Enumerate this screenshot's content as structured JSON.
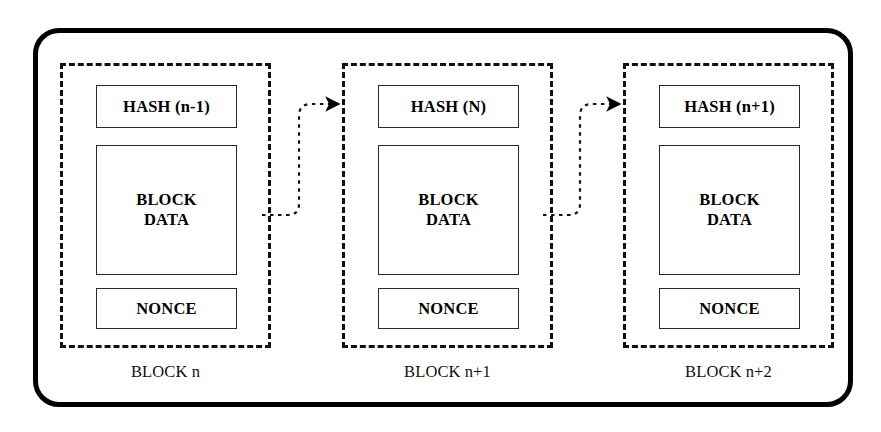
{
  "diagram": {
    "background_color": "#ffffff",
    "stroke_color": "#000000",
    "outer_frame": {
      "shape": "rounded-rectangle",
      "style": "solid",
      "stroke_width_px": 5,
      "corner_radius_px": 26
    }
  },
  "blocks": [
    {
      "id": "block-n",
      "label": "BLOCK n",
      "border_style": "dashed",
      "fields": {
        "hash": "HASH (n-1)",
        "data_line_1": "BLOCK",
        "data_line_2": "DATA",
        "nonce": "NONCE"
      }
    },
    {
      "id": "block-n-plus-1",
      "label": "BLOCK n+1",
      "border_style": "dashed",
      "fields": {
        "hash": "HASH (N)",
        "data_line_1": "BLOCK",
        "data_line_2": "DATA",
        "nonce": "NONCE"
      }
    },
    {
      "id": "block-n-plus-2",
      "label": "BLOCK n+2",
      "border_style": "dashed",
      "fields": {
        "hash": "HASH (n+1)",
        "data_line_1": "BLOCK",
        "data_line_2": "DATA",
        "nonce": "NONCE"
      }
    }
  ],
  "connectors": [
    {
      "id": "connector-1",
      "from": "block-n",
      "to": "block-n-plus-1",
      "style": "dotted",
      "arrowhead": "filled-triangle",
      "direction": "right"
    },
    {
      "id": "connector-2",
      "from": "block-n-plus-1",
      "to": "block-n-plus-2",
      "style": "dotted",
      "arrowhead": "filled-triangle",
      "direction": "right"
    }
  ]
}
